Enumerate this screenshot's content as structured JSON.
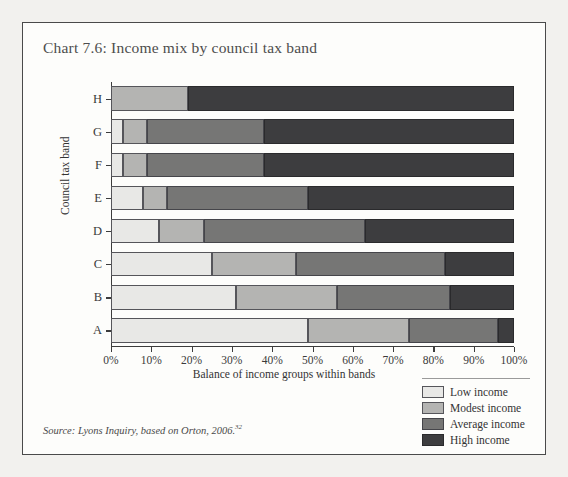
{
  "title": "Chart 7.6: Income mix by council tax band",
  "source": {
    "text": "Source: Lyons Inquiry, based on Orton, 2006.",
    "footnote": "32"
  },
  "legend": {
    "items": [
      {
        "key": "low",
        "label": "Low income",
        "color": "#e8e8e6"
      },
      {
        "key": "modest",
        "label": "Modest income",
        "color": "#b4b4b2"
      },
      {
        "key": "average",
        "label": "Average income",
        "color": "#767675"
      },
      {
        "key": "high",
        "label": "High income",
        "color": "#3d3d3f"
      }
    ]
  },
  "chart_data": {
    "type": "bar",
    "orientation": "horizontal",
    "stacked": true,
    "stack_total": 100,
    "title": "Chart 7.6: Income mix by council tax band",
    "xlabel": "Balance of income groups within bands",
    "ylabel": "Council tax band",
    "xlim": [
      0,
      100
    ],
    "xticks": [
      0,
      10,
      20,
      30,
      40,
      50,
      60,
      70,
      80,
      90,
      100
    ],
    "xtick_labels": [
      "0%",
      "10%",
      "20%",
      "30%",
      "40%",
      "50%",
      "60%",
      "70%",
      "80%",
      "90%",
      "100%"
    ],
    "grid": false,
    "legend_position": "bottom-right",
    "categories": [
      "H",
      "G",
      "F",
      "E",
      "D",
      "C",
      "B",
      "A"
    ],
    "series": [
      {
        "name": "Low income",
        "color": "#e8e8e6",
        "values": [
          0,
          3,
          3,
          8,
          12,
          25,
          31,
          49
        ]
      },
      {
        "name": "Modest income",
        "color": "#b4b4b2",
        "values": [
          19,
          6,
          6,
          6,
          11,
          21,
          25,
          25
        ]
      },
      {
        "name": "Average income",
        "color": "#767675",
        "values": [
          0,
          29,
          29,
          35,
          40,
          37,
          28,
          22
        ]
      },
      {
        "name": "High income",
        "color": "#3d3d3f",
        "values": [
          81,
          62,
          62,
          51,
          37,
          17,
          16,
          4
        ]
      }
    ]
  }
}
